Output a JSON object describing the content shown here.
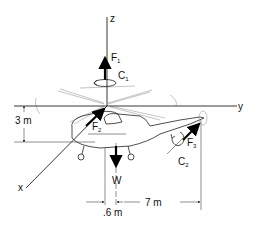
{
  "diagram": {
    "axes": {
      "x": "x",
      "y": "y",
      "z": "z"
    },
    "forces": [
      {
        "name": "F",
        "subscript": "1",
        "direction": "+z (upward along rotor shaft)"
      },
      {
        "name": "F",
        "subscript": "2",
        "direction": "along -x axis toward rotor hub"
      },
      {
        "name": "F",
        "subscript": "3",
        "direction": "tail rotor thrust"
      },
      {
        "name": "W",
        "subscript": "",
        "direction": "downward (weight)"
      }
    ],
    "couples": [
      {
        "name": "C",
        "subscript": "1",
        "location": "main rotor shaft"
      },
      {
        "name": "C",
        "subscript": "2",
        "location": "tail rotor"
      }
    ],
    "dimensions": {
      "height": "3 m",
      "w_offset": ".6 m",
      "tail_distance": "7 m"
    }
  }
}
